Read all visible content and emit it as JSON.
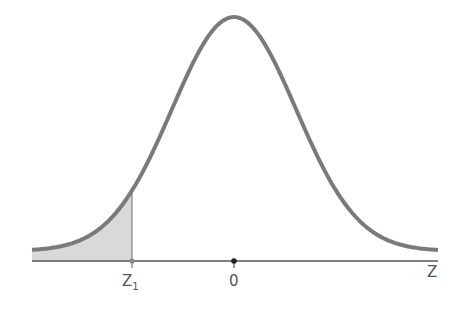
{
  "diagram": {
    "type": "normal-distribution-curve",
    "axis_label": "Z",
    "ticks": [
      {
        "label": "Z",
        "sub": "1",
        "position": "left tail cutoff"
      },
      {
        "label": "0",
        "position": "mean"
      }
    ],
    "shaded_region": "left tail below Z1",
    "colors": {
      "curve": "#777777",
      "shade": "#d8d8d8",
      "axis": "#555555",
      "mean_dot": "#222222"
    }
  }
}
